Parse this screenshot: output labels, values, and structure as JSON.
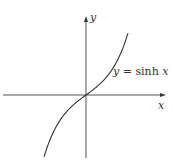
{
  "chart_data": {
    "type": "line",
    "title": "",
    "xlabel": "x",
    "ylabel": "y",
    "annotation": "y = sinh x",
    "function": "sinh",
    "grid": false,
    "ticks": false,
    "legend": "none",
    "xlim": [
      -2.3,
      2.3
    ],
    "ylim": [
      -4.5,
      4.5
    ],
    "series": [
      {
        "name": "y = sinh x",
        "x": [
          -2.2,
          -2.0,
          -1.5,
          -1.0,
          -0.5,
          0.0,
          0.5,
          1.0,
          1.5,
          2.0,
          2.2
        ],
        "values": [
          -4.46,
          -3.63,
          -2.13,
          -1.18,
          -0.52,
          0.0,
          0.52,
          1.18,
          2.13,
          3.63,
          4.46
        ]
      }
    ],
    "colors": {
      "axis": "#555555",
      "curve": "#333333",
      "background": "#ffffff"
    }
  },
  "labels": {
    "y_axis": "y",
    "x_axis": "x",
    "curve_prefix": "y",
    "curve_eq": " = sinh ",
    "curve_var": "x"
  }
}
